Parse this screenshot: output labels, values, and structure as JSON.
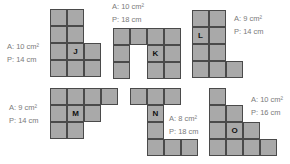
{
  "figure": {
    "cell_color": "#a9a9a9",
    "grid_color": "#4a4a4a",
    "cell_size_px": 17,
    "shapes": [
      {
        "id": "J",
        "area": "A: 10 cm²",
        "perimeter": "P: 14 cm",
        "origin": [
          50,
          9
        ],
        "cells": [
          [
            0,
            0
          ],
          [
            1,
            0
          ],
          [
            0,
            1
          ],
          [
            1,
            1
          ],
          [
            0,
            2
          ],
          [
            1,
            2
          ],
          [
            2,
            2
          ],
          [
            0,
            3
          ],
          [
            1,
            3
          ],
          [
            2,
            3
          ]
        ],
        "letter_cell": [
          1,
          2
        ],
        "label_pos": [
          7,
          40
        ]
      },
      {
        "id": "K",
        "area": "A: 10 cm²",
        "perimeter": "P: 18 cm",
        "origin": [
          113,
          28
        ],
        "cells": [
          [
            0,
            0
          ],
          [
            1,
            0
          ],
          [
            2,
            0
          ],
          [
            3,
            0
          ],
          [
            0,
            1
          ],
          [
            2,
            1
          ],
          [
            3,
            1
          ],
          [
            0,
            2
          ],
          [
            2,
            2
          ],
          [
            3,
            2
          ]
        ],
        "letter_cell": [
          2,
          1
        ],
        "label_pos": [
          112,
          0
        ]
      },
      {
        "id": "L",
        "area": "A: 9 cm²",
        "perimeter": "P: 14 cm",
        "origin": [
          192,
          10
        ],
        "cells": [
          [
            0,
            0
          ],
          [
            1,
            0
          ],
          [
            0,
            1
          ],
          [
            1,
            1
          ],
          [
            0,
            2
          ],
          [
            1,
            2
          ],
          [
            0,
            3
          ],
          [
            1,
            3
          ],
          [
            2,
            3
          ]
        ],
        "letter_cell": [
          0,
          1
        ],
        "label_pos": [
          234,
          12
        ]
      },
      {
        "id": "M",
        "area": "A: 9 cm²",
        "perimeter": "P: 14 cm",
        "origin": [
          50,
          88
        ],
        "cells": [
          [
            0,
            0
          ],
          [
            1,
            0
          ],
          [
            2,
            0
          ],
          [
            3,
            0
          ],
          [
            0,
            1
          ],
          [
            1,
            1
          ],
          [
            2,
            1
          ],
          [
            0,
            2
          ],
          [
            1,
            2
          ]
        ],
        "letter_cell": [
          1,
          1
        ],
        "label_pos": [
          9,
          101
        ]
      },
      {
        "id": "N",
        "area": "A: 8 cm²",
        "perimeter": "P: 18 cm",
        "origin": [
          130,
          88
        ],
        "cells": [
          [
            0,
            0
          ],
          [
            1,
            0
          ],
          [
            2,
            0
          ],
          [
            1,
            1
          ],
          [
            1,
            2
          ],
          [
            1,
            3
          ],
          [
            2,
            3
          ],
          [
            3,
            3
          ]
        ],
        "letter_cell": [
          1,
          1
        ],
        "label_pos": [
          169,
          112
        ]
      },
      {
        "id": "O",
        "area": "A: 10 cm²",
        "perimeter": "P: 16 cm",
        "origin": [
          209,
          88
        ],
        "cells": [
          [
            0,
            0
          ],
          [
            0,
            1
          ],
          [
            1,
            1
          ],
          [
            0,
            2
          ],
          [
            1,
            2
          ],
          [
            2,
            2
          ],
          [
            0,
            3
          ],
          [
            1,
            3
          ],
          [
            2,
            3
          ],
          [
            3,
            3
          ]
        ],
        "letter_cell": [
          1,
          2
        ],
        "label_pos": [
          251,
          93
        ]
      }
    ]
  }
}
